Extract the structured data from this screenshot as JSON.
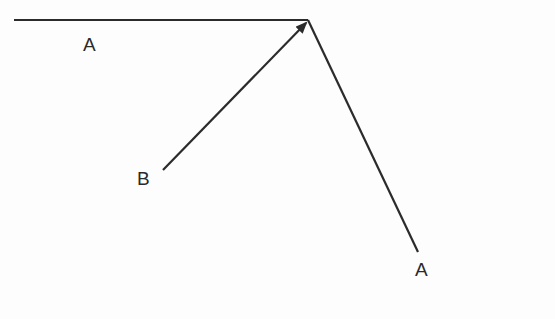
{
  "diagram": {
    "type": "vector-diagram",
    "stroke_color": "#2b2b2b",
    "vectors": [
      {
        "name": "A-horizontal",
        "from": [
          14,
          20
        ],
        "to": [
          308,
          20
        ],
        "arrow": false
      },
      {
        "name": "B",
        "from": [
          163,
          170
        ],
        "to": [
          306,
          23
        ],
        "arrow": true
      },
      {
        "name": "A-diagonal",
        "from": [
          308,
          20
        ],
        "to": [
          418,
          252
        ],
        "arrow": false
      }
    ],
    "labels": [
      {
        "id": "label-a-top",
        "text": "A",
        "x": 83,
        "y": 34
      },
      {
        "id": "label-b",
        "text": "B",
        "x": 137,
        "y": 168
      },
      {
        "id": "label-a-bottom",
        "text": "A",
        "x": 415,
        "y": 259
      }
    ]
  }
}
